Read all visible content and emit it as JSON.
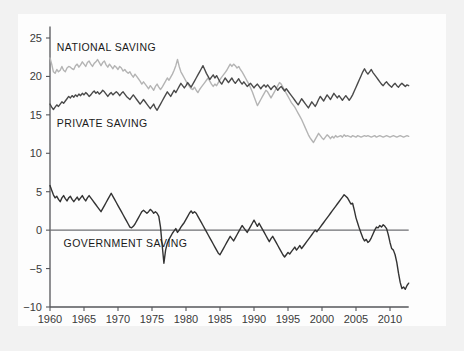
{
  "figure": {
    "background_color": "#f2f2f2",
    "panel_color": "#fdfdfd"
  },
  "chart_data": {
    "type": "line",
    "title": "",
    "subtitle": "",
    "xlabel": "",
    "ylabel": "",
    "xlim": [
      1960,
      2012.75
    ],
    "ylim": [
      -10,
      26.5
    ],
    "grid": false,
    "legend_position": "inline-annotations",
    "x_ticks": [
      1960,
      1965,
      1970,
      1975,
      1980,
      1985,
      1990,
      1995,
      2000,
      2005,
      2010
    ],
    "x_tick_labels": [
      "1960",
      "1965",
      "1970",
      "1975",
      "1980",
      "1985",
      "1990",
      "1995",
      "2000",
      "2005",
      "2010"
    ],
    "y_ticks": [
      -10,
      -5,
      0,
      5,
      10,
      15,
      20,
      25
    ],
    "y_tick_labels": [
      "−10",
      "−5",
      "0",
      "5",
      "10",
      "15",
      "20",
      "25"
    ],
    "zero_line": 0,
    "annotations": [
      {
        "name": "national-saving-label",
        "text": "NATIONAL SAVING",
        "x": 1961.0,
        "y": 23.3
      },
      {
        "name": "private-saving-label",
        "text": "PRIVATE  SAVING",
        "x": 1961.0,
        "y": 13.4
      },
      {
        "name": "government-saving-label",
        "text": "GOVERNMENT SAVING",
        "x": 1962.0,
        "y": -2.2
      }
    ],
    "series": [
      {
        "name": "National Saving",
        "color": "#b4b4b4",
        "linewidth": 1.4,
        "x_start": 1960.0,
        "x_step": 0.25,
        "values": [
          22.4,
          21.6,
          20.6,
          20.4,
          20.9,
          20.6,
          20.8,
          21.3,
          20.8,
          20.6,
          21.1,
          21.3,
          21.2,
          21.0,
          20.9,
          21.4,
          21.6,
          21.2,
          21.5,
          21.9,
          21.6,
          21.3,
          21.8,
          22.0,
          21.6,
          21.3,
          21.7,
          21.9,
          22.2,
          21.8,
          21.4,
          21.8,
          22.0,
          21.5,
          21.2,
          21.6,
          21.3,
          21.0,
          21.4,
          21.2,
          20.9,
          21.3,
          21.1,
          20.7,
          20.9,
          20.6,
          20.4,
          20.6,
          20.2,
          19.9,
          20.3,
          20.0,
          19.7,
          19.4,
          19.0,
          19.3,
          19.0,
          18.7,
          18.4,
          18.8,
          18.5,
          18.2,
          18.7,
          19.0,
          18.6,
          18.3,
          18.6,
          19.0,
          19.4,
          19.8,
          19.5,
          19.9,
          20.3,
          20.8,
          21.4,
          22.2,
          21.3,
          20.6,
          20.2,
          19.8,
          19.4,
          19.0,
          18.7,
          18.4,
          18.3,
          18.6,
          18.2,
          17.9,
          18.3,
          18.6,
          18.9,
          19.2,
          19.5,
          19.8,
          19.4,
          19.0,
          18.7,
          19.0,
          18.8,
          19.2,
          19.6,
          19.9,
          20.2,
          20.5,
          20.8,
          21.2,
          21.6,
          21.3,
          21.6,
          21.4,
          21.1,
          21.3,
          20.9,
          20.6,
          20.2,
          19.8,
          19.4,
          19.0,
          18.5,
          18.0,
          17.4,
          16.8,
          16.2,
          16.6,
          17.0,
          17.4,
          17.8,
          18.2,
          18.0,
          17.6,
          17.2,
          17.6,
          18.0,
          18.4,
          18.8,
          19.2,
          19.0,
          18.6,
          18.2,
          17.8,
          17.4,
          17.0,
          16.6,
          16.3,
          16.0,
          15.6,
          15.2,
          14.8,
          14.4,
          13.9,
          13.4,
          12.9,
          12.4,
          12.0,
          11.7,
          11.4,
          11.8,
          12.2,
          12.6,
          12.3,
          12.0,
          11.8,
          12.1,
          12.4,
          12.2,
          11.9,
          12.2,
          12.0,
          12.3,
          12.1,
          12.2,
          12.3,
          12.1,
          12.4,
          12.2,
          12.3,
          12.2,
          12.1,
          12.3,
          12.2,
          12.1,
          12.3,
          12.2,
          12.1,
          12.2,
          12.3,
          12.2,
          12.3,
          12.2,
          12.1,
          12.2,
          12.3,
          12.1,
          12.2,
          12.3,
          12.2,
          12.1,
          12.2,
          12.3,
          12.2,
          12.1,
          12.2,
          12.3,
          12.2,
          12.1,
          12.2,
          12.3,
          12.2,
          12.1,
          12.2,
          12.3,
          12.2
        ]
      },
      {
        "name": "Private Saving",
        "color": "#4a4a4a",
        "linewidth": 1.4,
        "x_start": 1960.0,
        "x_step": 0.25,
        "values": [
          16.4,
          16.0,
          15.7,
          16.0,
          16.3,
          16.1,
          16.4,
          16.7,
          16.5,
          16.8,
          17.1,
          17.4,
          17.2,
          17.5,
          17.3,
          17.6,
          17.4,
          17.7,
          17.5,
          17.8,
          17.6,
          17.9,
          17.7,
          17.4,
          17.6,
          17.9,
          18.1,
          17.8,
          18.0,
          17.7,
          17.9,
          18.2,
          18.0,
          17.7,
          17.4,
          17.7,
          17.9,
          17.6,
          17.8,
          18.0,
          17.8,
          17.5,
          17.8,
          18.0,
          17.7,
          17.4,
          17.2,
          17.0,
          17.3,
          17.6,
          17.3,
          17.0,
          16.7,
          16.4,
          16.7,
          17.0,
          16.7,
          16.4,
          16.1,
          15.8,
          16.1,
          16.4,
          15.9,
          15.6,
          16.0,
          16.4,
          16.8,
          17.2,
          17.6,
          18.0,
          17.7,
          17.4,
          17.8,
          18.2,
          17.9,
          18.3,
          18.7,
          19.1,
          18.8,
          18.5,
          18.8,
          19.2,
          18.9,
          18.6,
          19.0,
          19.4,
          19.8,
          20.2,
          20.6,
          21.0,
          21.4,
          20.9,
          20.4,
          20.0,
          19.6,
          19.9,
          20.2,
          19.8,
          20.1,
          19.7,
          19.3,
          19.0,
          19.4,
          19.8,
          19.5,
          19.2,
          19.5,
          19.8,
          19.4,
          19.1,
          19.4,
          19.7,
          19.3,
          19.0,
          19.3,
          19.0,
          18.7,
          18.9,
          19.1,
          18.8,
          18.5,
          18.8,
          19.0,
          18.7,
          18.4,
          18.7,
          18.9,
          18.6,
          18.9,
          18.6,
          18.3,
          18.6,
          18.8,
          18.5,
          18.2,
          18.5,
          18.7,
          18.4,
          18.1,
          18.4,
          18.1,
          17.8,
          17.5,
          17.2,
          16.9,
          16.6,
          16.3,
          16.7,
          17.1,
          16.8,
          16.5,
          16.2,
          15.9,
          16.3,
          16.7,
          16.4,
          16.1,
          16.5,
          17.0,
          17.4,
          17.1,
          16.8,
          17.2,
          17.6,
          17.3,
          17.0,
          17.4,
          17.8,
          17.5,
          17.2,
          17.5,
          17.2,
          16.9,
          17.2,
          17.5,
          17.2,
          16.9,
          17.2,
          17.6,
          18.1,
          18.6,
          19.1,
          19.6,
          20.1,
          20.6,
          21.0,
          20.6,
          20.3,
          20.6,
          20.9,
          20.5,
          20.2,
          19.9,
          19.6,
          19.3,
          19.0,
          18.8,
          19.1,
          19.3,
          19.0,
          18.8,
          18.6,
          18.9,
          19.1,
          18.8,
          18.6,
          18.9,
          19.1,
          18.9,
          18.7,
          18.9,
          18.8
        ]
      },
      {
        "name": "Government Saving",
        "color": "#333333",
        "linewidth": 1.4,
        "x_start": 1960.0,
        "x_step": 0.25,
        "values": [
          5.8,
          5.2,
          4.6,
          4.2,
          4.4,
          4.0,
          3.7,
          4.2,
          4.5,
          4.1,
          3.8,
          4.2,
          4.4,
          4.0,
          3.7,
          4.0,
          4.3,
          3.9,
          4.2,
          4.5,
          4.1,
          3.8,
          4.2,
          4.5,
          4.2,
          3.9,
          3.6,
          3.3,
          3.0,
          2.7,
          2.4,
          2.8,
          3.2,
          3.6,
          4.0,
          4.4,
          4.8,
          4.4,
          4.0,
          3.6,
          3.2,
          2.8,
          2.4,
          2.0,
          1.6,
          1.2,
          0.8,
          0.4,
          0.3,
          0.5,
          0.8,
          1.2,
          1.6,
          2.0,
          2.4,
          2.6,
          2.4,
          2.2,
          2.4,
          2.7,
          2.5,
          2.2,
          2.4,
          2.2,
          1.8,
          0.4,
          -2.0,
          -4.3,
          -2.6,
          -1.7,
          -1.2,
          -0.8,
          -0.4,
          -0.1,
          0.2,
          -0.3,
          0.0,
          0.4,
          0.7,
          1.0,
          1.4,
          1.8,
          2.2,
          2.5,
          2.2,
          2.4,
          2.2,
          1.8,
          1.4,
          1.0,
          0.6,
          0.2,
          -0.2,
          -0.6,
          -1.0,
          -1.4,
          -1.8,
          -2.2,
          -2.6,
          -3.0,
          -3.2,
          -2.8,
          -2.4,
          -2.0,
          -1.6,
          -1.2,
          -0.8,
          -1.1,
          -1.4,
          -1.0,
          -0.6,
          -0.2,
          0.2,
          0.6,
          0.3,
          0.0,
          -0.3,
          0.1,
          0.5,
          0.9,
          1.3,
          0.9,
          0.5,
          0.9,
          0.5,
          0.1,
          -0.3,
          -0.7,
          -1.1,
          -1.5,
          -1.1,
          -0.8,
          -1.2,
          -1.6,
          -2.0,
          -2.4,
          -2.8,
          -3.2,
          -3.5,
          -3.2,
          -2.9,
          -3.1,
          -2.8,
          -2.5,
          -2.2,
          -2.6,
          -2.3,
          -2.0,
          -2.4,
          -2.1,
          -1.8,
          -1.5,
          -1.2,
          -0.9,
          -0.6,
          -0.3,
          0.0,
          -0.2,
          0.1,
          0.4,
          0.7,
          1.0,
          1.3,
          1.6,
          1.9,
          2.2,
          2.5,
          2.8,
          3.1,
          3.4,
          3.7,
          4.0,
          4.3,
          4.6,
          4.4,
          4.2,
          3.8,
          3.4,
          3.5,
          2.6,
          1.6,
          0.9,
          0.2,
          -0.4,
          -1.0,
          -1.4,
          -1.2,
          -1.6,
          -1.4,
          -1.0,
          -0.5,
          0.0,
          0.4,
          0.3,
          0.6,
          0.4,
          0.7,
          0.5,
          0.2,
          -0.6,
          -1.6,
          -2.4,
          -2.6,
          -3.2,
          -4.2,
          -5.6,
          -6.8,
          -7.6,
          -7.4,
          -7.7,
          -7.2,
          -6.9,
          -7.1,
          -6.8,
          -6.4,
          -6.6,
          -6.2,
          -5.7
        ]
      }
    ]
  }
}
